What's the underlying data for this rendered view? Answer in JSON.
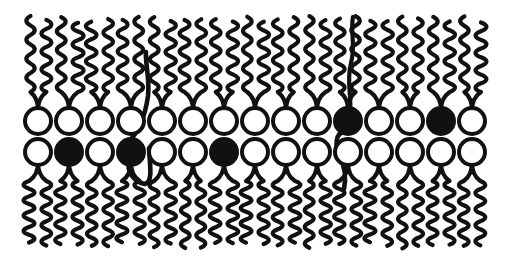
{
  "figure": {
    "background_color": "#ffffff",
    "stroke_color": "#111111",
    "head_open_fill": "#ffffff",
    "head_filled_fill": "#111111",
    "width": 506,
    "height": 264
  },
  "geometry": {
    "head_radius": 13,
    "head_stroke_width": 4.0,
    "tail_stroke_width": 4.2,
    "column_spacing": 31,
    "first_column_x": 38,
    "column_count": 15,
    "upper_head_y": 121,
    "lower_head_y": 152,
    "upper_tail_top_y": 16,
    "lower_tail_bottom_y": 249,
    "tail_offset": 7.5,
    "wave_amplitude": 6.5,
    "wave_count": 4
  },
  "leaflets": [
    {
      "name": "upper-leaflet",
      "label": "Outer leaflet",
      "direction": "up",
      "lipids": [
        {
          "index": 1,
          "x": 38,
          "fill": "open",
          "flip": "none"
        },
        {
          "index": 2,
          "x": 69,
          "fill": "open",
          "flip": "none"
        },
        {
          "index": 3,
          "x": 100,
          "fill": "open",
          "flip": "none"
        },
        {
          "index": 4,
          "x": 131,
          "fill": "open",
          "flip": "none"
        },
        {
          "index": 5,
          "x": 162,
          "fill": "open",
          "flip": "none"
        },
        {
          "index": 6,
          "x": 193,
          "fill": "open",
          "flip": "none"
        },
        {
          "index": 7,
          "x": 224,
          "fill": "open",
          "flip": "none"
        },
        {
          "index": 8,
          "x": 255,
          "fill": "open",
          "flip": "none"
        },
        {
          "index": 9,
          "x": 286,
          "fill": "open",
          "flip": "none"
        },
        {
          "index": 10,
          "x": 317,
          "fill": "open",
          "flip": "none"
        },
        {
          "index": 11,
          "x": 348,
          "fill": "filled",
          "flip": "tail-down"
        },
        {
          "index": 12,
          "x": 379,
          "fill": "open",
          "flip": "none"
        },
        {
          "index": 13,
          "x": 410,
          "fill": "open",
          "flip": "none"
        },
        {
          "index": 14,
          "x": 441,
          "fill": "filled",
          "flip": "none"
        },
        {
          "index": 15,
          "x": 472,
          "fill": "open",
          "flip": "none"
        }
      ]
    },
    {
      "name": "lower-leaflet",
      "label": "Inner leaflet",
      "direction": "down",
      "lipids": [
        {
          "index": 1,
          "x": 38,
          "fill": "open",
          "flip": "none"
        },
        {
          "index": 2,
          "x": 69,
          "fill": "filled",
          "flip": "none"
        },
        {
          "index": 3,
          "x": 100,
          "fill": "open",
          "flip": "none"
        },
        {
          "index": 4,
          "x": 131,
          "fill": "filled",
          "flip": "none"
        },
        {
          "index": 5,
          "x": 162,
          "fill": "open",
          "flip": "none"
        },
        {
          "index": 6,
          "x": 193,
          "fill": "open",
          "flip": "none"
        },
        {
          "index": 7,
          "x": 224,
          "fill": "filled",
          "flip": "tail-up"
        },
        {
          "index": 8,
          "x": 255,
          "fill": "open",
          "flip": "none"
        },
        {
          "index": 9,
          "x": 286,
          "fill": "open",
          "flip": "none"
        },
        {
          "index": 10,
          "x": 317,
          "fill": "open",
          "flip": "none"
        },
        {
          "index": 11,
          "x": 348,
          "fill": "open",
          "flip": "none"
        },
        {
          "index": 12,
          "x": 379,
          "fill": "open",
          "flip": "none"
        },
        {
          "index": 13,
          "x": 410,
          "fill": "open",
          "flip": "none"
        },
        {
          "index": 14,
          "x": 441,
          "fill": "open",
          "flip": "none"
        },
        {
          "index": 15,
          "x": 472,
          "fill": "open",
          "flip": "none"
        }
      ]
    }
  ],
  "crossing_lipids": [
    {
      "name": "flip-flop-lipid-left",
      "origin_leaflet": "lower-leaflet",
      "origin_index": 4,
      "head_x": 131,
      "head_y": 152,
      "head_fill": "filled",
      "note": "tail rises from the inner leaflet head through the midplane to the outer leaflet surface"
    },
    {
      "name": "flip-flop-lipid-right",
      "origin_leaflet": "upper-leaflet",
      "origin_index": 11,
      "head_x": 348,
      "head_y": 121,
      "head_fill": "filled",
      "note": "tail descends from the outer leaflet head across the midplane into the inner leaflet"
    }
  ]
}
